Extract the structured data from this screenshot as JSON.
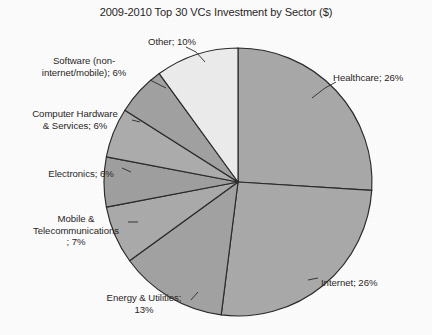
{
  "chart_data": {
    "type": "pie",
    "title": "2009-2010 Top 30 VCs Investment by Sector ($)",
    "unit": "%",
    "start_angle_deg": 0,
    "direction": "clockwise",
    "legend": "none (direct labels with leader lines)",
    "categories": [
      "Healthcare",
      "Internet",
      "Energy & Utilities",
      "Mobile & Telecommunications",
      "Electronics",
      "Computer Hardware & Services",
      "Software (non-internet/mobile)",
      "Other"
    ],
    "values": [
      26,
      26,
      13,
      7,
      6,
      6,
      6,
      10
    ],
    "slices": [
      {
        "label": "Healthcare",
        "value": 26,
        "text": "Healthcare; 26%",
        "color": "#a9a9a9"
      },
      {
        "label": "Internet",
        "value": 26,
        "text": "Internet; 26%",
        "color": "#aaaaaa"
      },
      {
        "label": "Energy & Utilities",
        "value": 13,
        "text": "Energy & Utilities; 13%",
        "color": "#a3a3a3"
      },
      {
        "label": "Mobile & Telecommunications",
        "value": 7,
        "text": "Mobile & Telecommunications; 7%",
        "color": "#ababab"
      },
      {
        "label": "Electronics",
        "value": 6,
        "text": "Electronics; 6%",
        "color": "#a0a0a0"
      },
      {
        "label": "Computer Hardware & Services",
        "value": 6,
        "text": "Computer Hardware & Services; 6%",
        "color": "#adadad"
      },
      {
        "label": "Software (non-internet/mobile)",
        "value": 6,
        "text": "Software (non-internet/mobile); 6%",
        "color": "#a2a2a2"
      },
      {
        "label": "Other",
        "value": 10,
        "text": "Other; 10%",
        "color": "#ededed"
      }
    ]
  },
  "labels": {
    "other": "Other; 10%",
    "healthcare": "Healthcare; 26%",
    "software_line1": "Software (non-",
    "software_line2": "internet/mobile); 6%",
    "hardware_line1": "Computer Hardware",
    "hardware_line2": "& Services; 6%",
    "electronics": "Electronics; 6%",
    "mobile_line1": "Mobile &",
    "mobile_line2": "Telecommunications",
    "mobile_line3": "; 7%",
    "energy_line1": "Energy & Utilities;",
    "energy_line2": "13%",
    "internet": "Internet; 26%"
  },
  "geometry": {
    "center_x": 238,
    "center_y": 182,
    "radius": 134
  },
  "colors": {
    "background": "#fdfdfd",
    "outline": "#2b2b2b",
    "text": "#2a2726",
    "slice_default": "#a8a8a8",
    "slice_light": "#ededed"
  }
}
